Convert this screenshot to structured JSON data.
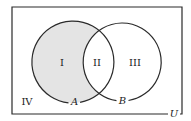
{
  "diagram": {
    "type": "venn",
    "universe_label": "U",
    "sets": [
      {
        "name": "A",
        "label": "A"
      },
      {
        "name": "B",
        "label": "B"
      }
    ],
    "regions": [
      {
        "id": "I",
        "label": "I",
        "description": "A only",
        "shaded": true
      },
      {
        "id": "II",
        "label": "II",
        "description": "A and B",
        "shaded": false
      },
      {
        "id": "III",
        "label": "III",
        "description": "B only",
        "shaded": false
      },
      {
        "id": "IV",
        "label": "IV",
        "description": "outside A and B",
        "shaded": false
      }
    ],
    "colors": {
      "stroke": "#2a2a2a",
      "shade": "#e4e4e4",
      "background": "#ffffff"
    }
  }
}
